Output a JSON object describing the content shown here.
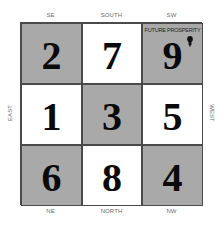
{
  "diagram": {
    "type": "flying-star-grid",
    "directions": {
      "top": [
        "SE",
        "SOUTH",
        "SW"
      ],
      "bottom": [
        "NE",
        "NORTH",
        "NW"
      ],
      "left": "EAST",
      "right": "WEST"
    },
    "cells": [
      {
        "position": "SE",
        "number": "2",
        "shaded": true
      },
      {
        "position": "SOUTH",
        "number": "7",
        "shaded": false
      },
      {
        "position": "SW",
        "number": "9",
        "shaded": true,
        "label": "FUTURE PROSPERITY",
        "icon": "light-bulb-icon"
      },
      {
        "position": "EAST",
        "number": "1",
        "shaded": false
      },
      {
        "position": "CENTER",
        "number": "3",
        "shaded": true
      },
      {
        "position": "WEST",
        "number": "5",
        "shaded": false
      },
      {
        "position": "NE",
        "number": "6",
        "shaded": true
      },
      {
        "position": "NORTH",
        "number": "8",
        "shaded": false
      },
      {
        "position": "NW",
        "number": "4",
        "shaded": true
      }
    ],
    "colors": {
      "shaded": "#a9a9a9",
      "plain": "#ffffff",
      "border": "#4a4a4a",
      "number": "#0a0a0a"
    }
  }
}
